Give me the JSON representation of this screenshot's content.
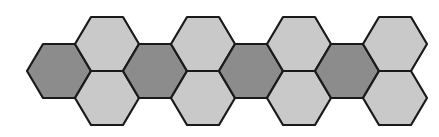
{
  "diagram": {
    "colors": {
      "dark_fill": "#8c8c8c",
      "light_fill": "#c9c9c9",
      "stroke": "#1a1a1a",
      "background": "#ffffff"
    },
    "geometry": {
      "half_width": 32,
      "half_height": 27
    },
    "hexagons": [
      {
        "id": "dark-1",
        "shade": "dark",
        "cx": 59,
        "cy": 71
      },
      {
        "id": "light-top-1",
        "shade": "light",
        "cx": 107,
        "cy": 44
      },
      {
        "id": "light-bottom-1",
        "shade": "light",
        "cx": 107,
        "cy": 98
      },
      {
        "id": "dark-2",
        "shade": "dark",
        "cx": 155,
        "cy": 71
      },
      {
        "id": "light-top-2",
        "shade": "light",
        "cx": 203,
        "cy": 44
      },
      {
        "id": "light-bottom-2",
        "shade": "light",
        "cx": 203,
        "cy": 98
      },
      {
        "id": "dark-3",
        "shade": "dark",
        "cx": 251,
        "cy": 71
      },
      {
        "id": "light-top-3",
        "shade": "light",
        "cx": 299,
        "cy": 44
      },
      {
        "id": "light-bottom-3",
        "shade": "light",
        "cx": 299,
        "cy": 98
      },
      {
        "id": "dark-4",
        "shade": "dark",
        "cx": 347,
        "cy": 71
      },
      {
        "id": "light-top-4",
        "shade": "light",
        "cx": 395,
        "cy": 44
      },
      {
        "id": "light-bottom-4",
        "shade": "light",
        "cx": 395,
        "cy": 98
      }
    ]
  }
}
